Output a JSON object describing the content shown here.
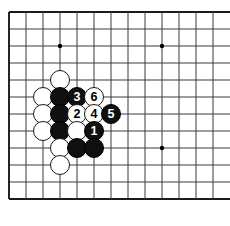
{
  "figure": {
    "background_color": "#ffffff",
    "width": 230,
    "height": 226
  },
  "board": {
    "line_color": "#3a3a3a",
    "border_color": "#1a1a1a",
    "star_point_color": "#000000",
    "origin_x": 9,
    "origin_y": 12,
    "spacing": 17,
    "columns": 13,
    "rows": 12,
    "star_points": [
      {
        "col": 3,
        "row": 2
      },
      {
        "col": 9,
        "row": 2
      },
      {
        "col": 9,
        "row": 8
      }
    ]
  },
  "stones": [
    {
      "col": 3,
      "row": 4,
      "color": "white",
      "label": ""
    },
    {
      "col": 2,
      "row": 5,
      "color": "white",
      "label": ""
    },
    {
      "col": 3,
      "row": 5,
      "color": "black",
      "label": ""
    },
    {
      "col": 4,
      "row": 5,
      "color": "black",
      "label": "3"
    },
    {
      "col": 5,
      "row": 5,
      "color": "white",
      "label": "6"
    },
    {
      "col": 2,
      "row": 6,
      "color": "white",
      "label": ""
    },
    {
      "col": 3,
      "row": 6,
      "color": "black",
      "label": ""
    },
    {
      "col": 4,
      "row": 6,
      "color": "white",
      "label": "2"
    },
    {
      "col": 5,
      "row": 6,
      "color": "white",
      "label": "4"
    },
    {
      "col": 6,
      "row": 6,
      "color": "black",
      "label": "5"
    },
    {
      "col": 2,
      "row": 7,
      "color": "white",
      "label": ""
    },
    {
      "col": 3,
      "row": 7,
      "color": "black",
      "label": ""
    },
    {
      "col": 4,
      "row": 7,
      "color": "white",
      "label": ""
    },
    {
      "col": 5,
      "row": 7,
      "color": "black",
      "label": "1"
    },
    {
      "col": 3,
      "row": 8,
      "color": "white",
      "label": ""
    },
    {
      "col": 4,
      "row": 8,
      "color": "black",
      "label": ""
    },
    {
      "col": 5,
      "row": 8,
      "color": "black",
      "label": ""
    },
    {
      "col": 3,
      "row": 9,
      "color": "white",
      "label": ""
    }
  ],
  "move_sequence": [
    {
      "number": "1",
      "color": "black"
    },
    {
      "number": "2",
      "color": "white"
    },
    {
      "number": "3",
      "color": "black"
    },
    {
      "number": "4",
      "color": "white"
    },
    {
      "number": "5",
      "color": "black"
    },
    {
      "number": "6",
      "color": "white"
    }
  ]
}
